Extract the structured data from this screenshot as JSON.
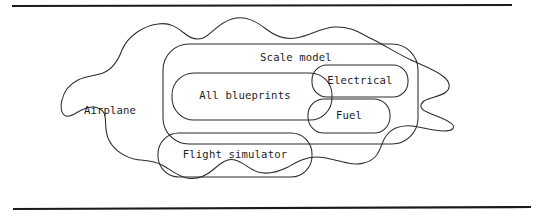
{
  "figure": {
    "type": "set-containment-diagram",
    "title": "",
    "background_color": "#ffffff",
    "line_color": "#2b2b2b",
    "rule_color": "#1a1a1a",
    "rules": {
      "top": {
        "x1": 12,
        "y1": 6,
        "x2": 512,
        "y2": 5
      },
      "bottom": {
        "x1": 13,
        "y1": 209,
        "x2": 531,
        "y2": 207
      }
    },
    "regions": [
      {
        "id": "airplane",
        "label": "Airplane",
        "shape": "blob",
        "label_x": 110,
        "label_y": 111
      },
      {
        "id": "scale-model",
        "label": "Scale model",
        "shape": "rounded-rect",
        "x": 163,
        "y": 44,
        "width": 255,
        "height": 100,
        "radius": 26,
        "label_x": 296,
        "label_y": 58
      },
      {
        "id": "all-blueprints",
        "label": "All blueprints",
        "shape": "rounded-rect",
        "x": 172,
        "y": 73,
        "width": 160,
        "height": 47,
        "radius": 22,
        "label_x": 245,
        "label_y": 96
      },
      {
        "id": "electrical",
        "label": "Electrical",
        "shape": "rounded-rect",
        "x": 312,
        "y": 65,
        "width": 96,
        "height": 32,
        "radius": 15,
        "label_x": 360,
        "label_y": 81
      },
      {
        "id": "fuel",
        "label": "Fuel",
        "shape": "rounded-rect",
        "x": 308,
        "y": 99,
        "width": 82,
        "height": 34,
        "radius": 16,
        "label_x": 349,
        "label_y": 116
      },
      {
        "id": "flight-simulator",
        "label": "Flight simulator",
        "shape": "rounded-rect",
        "x": 158,
        "y": 133,
        "width": 154,
        "height": 44,
        "radius": 21,
        "label_x": 235,
        "label_y": 155
      }
    ]
  }
}
